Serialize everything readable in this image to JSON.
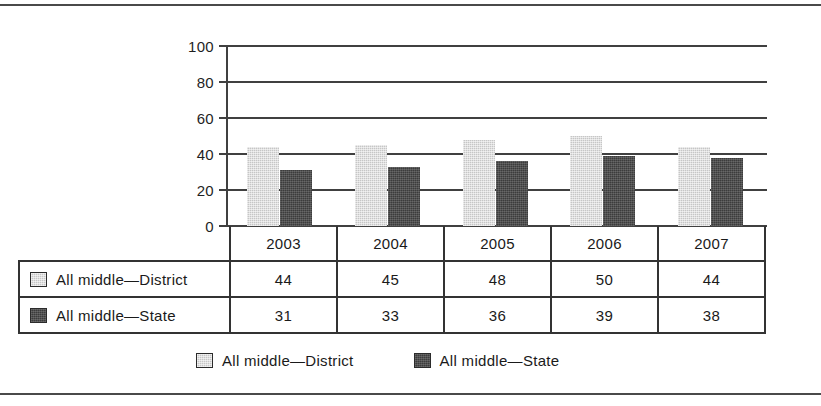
{
  "chart_data": {
    "type": "bar",
    "title": "",
    "subtitle": "",
    "xlabel": "",
    "ylabel": "",
    "categories": [
      "2003",
      "2004",
      "2005",
      "2006",
      "2007"
    ],
    "series": [
      {
        "name": "All middle—District",
        "values": [
          44,
          45,
          48,
          50,
          44
        ],
        "color": "#c6c6c6"
      },
      {
        "name": "All middle—State",
        "values": [
          31,
          33,
          36,
          39,
          38
        ],
        "color": "#3c3c3c"
      }
    ],
    "ylim": [
      0,
      100
    ],
    "yticks": [
      0,
      20,
      40,
      60,
      80,
      100
    ],
    "ytick_labels": [
      "0",
      "20",
      "40",
      "60",
      "80",
      "100"
    ],
    "grid": true,
    "grid_axis": "y",
    "legend_position": "bottom",
    "data_table": true
  },
  "axis": {
    "ticks": [
      {
        "label": "100",
        "value": 100
      },
      {
        "label": "80",
        "value": 80
      },
      {
        "label": "60",
        "value": 60
      },
      {
        "label": "40",
        "value": 40
      },
      {
        "label": "20",
        "value": 20
      },
      {
        "label": "0",
        "value": 0
      }
    ]
  },
  "table": {
    "header": [
      "",
      "2003",
      "2004",
      "2005",
      "2006",
      "2007"
    ],
    "rows": [
      {
        "label": "All middle—District",
        "values": [
          "44",
          "45",
          "48",
          "50",
          "44"
        ]
      },
      {
        "label": "All middle—State",
        "values": [
          "31",
          "33",
          "36",
          "39",
          "38"
        ]
      }
    ]
  },
  "legend": {
    "items": [
      {
        "label": "All middle—District",
        "swatch": "district"
      },
      {
        "label": "All middle—State",
        "swatch": "state"
      }
    ]
  },
  "colors": {
    "district": "#c6c6c6",
    "state": "#3c3c3c",
    "grid": "#404040",
    "border": "#333333",
    "rule": "#4a4a4a",
    "text": "#1a1a1a",
    "background": "#ffffff"
  }
}
